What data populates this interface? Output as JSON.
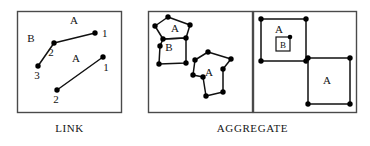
{
  "figure": {
    "stroke_color": "#111111",
    "panel_border_color": "#444444",
    "node_fill_color": "#000000",
    "background_color": "#ffffff"
  },
  "captions": {
    "link": "LINK",
    "aggregate": "AGGREGATE"
  },
  "panels": [
    {
      "id": "link-panel",
      "caption": "LINK",
      "box": {
        "x": 17,
        "y": 11,
        "w": 105,
        "h": 102
      },
      "chains": [
        {
          "id": "chain-upper",
          "edge_labels": [
            {
              "text": "A",
              "x": 74,
              "y": 24
            },
            {
              "text": "B",
              "x": 31,
              "y": 42
            }
          ],
          "nodes": [
            {
              "label": "1",
              "x": 95,
              "y": 33,
              "label_x": 102,
              "label_y": 33
            },
            {
              "label": "2",
              "x": 54,
              "y": 43,
              "label_x": 52,
              "label_y": 54
            },
            {
              "label": "3",
              "x": 38,
              "y": 66,
              "label_x": 37,
              "label_y": 78
            }
          ]
        },
        {
          "id": "chain-lower",
          "edge_labels": [
            {
              "text": "A",
              "x": 76,
              "y": 60
            }
          ],
          "nodes": [
            {
              "label": "1",
              "x": 103,
              "y": 57,
              "label_x": 107,
              "label_y": 67
            },
            {
              "label": "2",
              "x": 57,
              "y": 90,
              "label_x": 56,
              "label_y": 101
            }
          ]
        }
      ]
    },
    {
      "id": "aggregate-left-panel",
      "caption": "AGGREGATE",
      "box": {
        "x": 148,
        "y": 11,
        "w": 105,
        "h": 102
      },
      "polygons": [
        {
          "id": "polygon-a-upper",
          "label": {
            "text": "A",
            "x": 184,
            "y": 30
          },
          "points": [
            {
              "x": 168,
              "y": 17
            },
            {
              "x": 190,
              "y": 25
            },
            {
              "x": 186,
              "y": 38
            },
            {
              "x": 163,
              "y": 39
            },
            {
              "x": 155,
              "y": 26
            }
          ]
        },
        {
          "id": "polygon-b-lower",
          "label": {
            "text": "B",
            "x": 167,
            "y": 49
          },
          "points": [
            {
              "x": 163,
              "y": 39
            },
            {
              "x": 186,
              "y": 38
            },
            {
              "x": 186,
              "y": 63
            },
            {
              "x": 159,
              "y": 64
            },
            {
              "x": 160,
              "y": 46
            }
          ]
        },
        {
          "id": "polygon-a-second",
          "label": {
            "text": "A",
            "x": 208,
            "y": 72
          },
          "points": [
            {
              "x": 208,
              "y": 52
            },
            {
              "x": 231,
              "y": 59
            },
            {
              "x": 223,
              "y": 69
            },
            {
              "x": 223,
              "y": 92
            },
            {
              "x": 206,
              "y": 96
            },
            {
              "x": 203,
              "y": 77
            },
            {
              "x": 193,
              "y": 75
            },
            {
              "x": 195,
              "y": 60
            }
          ]
        }
      ]
    },
    {
      "id": "aggregate-right-panel",
      "caption": "AGGREGATE",
      "box": {
        "x": 253,
        "y": 11,
        "w": 104,
        "h": 102
      },
      "rects": [
        {
          "id": "rect-a-outer",
          "label": {
            "text": "A",
            "x": 277,
            "y": 30
          },
          "x": 260,
          "y": 19,
          "w": 45,
          "h": 42
        },
        {
          "id": "rect-b-inner",
          "label": {
            "text": "B",
            "x": 283,
            "y": 43
          },
          "x": 276,
          "y": 36,
          "w": 14,
          "h": 14,
          "boxed_label": true
        },
        {
          "id": "rect-a-second",
          "label": {
            "text": "A",
            "x": 323,
            "y": 78
          },
          "x": 308,
          "y": 58,
          "w": 42,
          "h": 46
        }
      ]
    }
  ]
}
